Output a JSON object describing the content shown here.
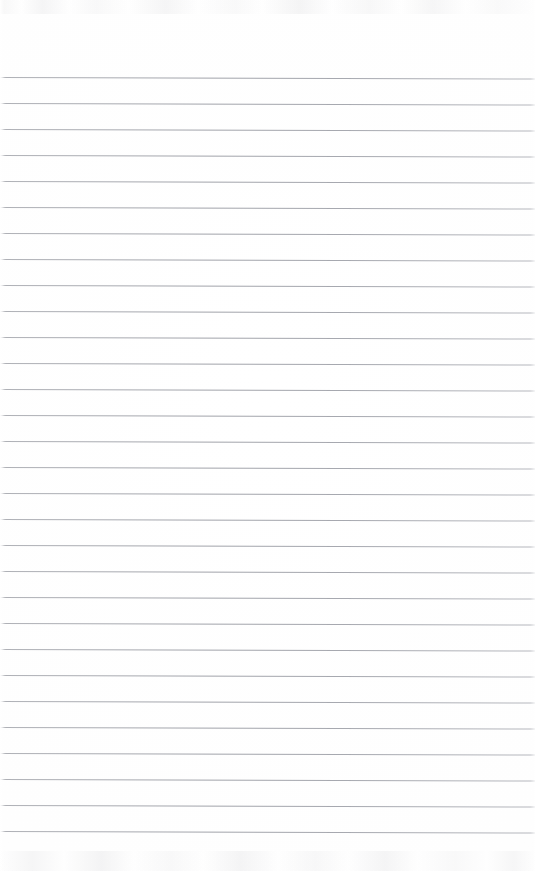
{
  "document": {
    "kind": "lined-notebook-page",
    "description": "Blank ruled notebook paper scan",
    "content_text": "",
    "has_handwriting": false,
    "has_margin_rule": false
  },
  "page": {
    "width_px": 535,
    "height_px": 871,
    "paper_color": "#fefefe",
    "background_color": "#ffffff"
  },
  "ruling": {
    "line_color": "#a0a2a9",
    "line_thickness_px": 1,
    "line_spacing_px": 26,
    "first_line_y_px": 77,
    "last_line_y_px": 847,
    "line_count": 30,
    "skew_degrees": 0.17,
    "left_inset_px": 0,
    "right_inset_px": 0,
    "line_y_positions": [
      77,
      103,
      129,
      155,
      181,
      207,
      233,
      259,
      285,
      311,
      321,
      337,
      363,
      389,
      415,
      441,
      467,
      493,
      519,
      545,
      571,
      597,
      623,
      649,
      675,
      701,
      727,
      743,
      769,
      795,
      821,
      847
    ]
  },
  "scan_artifacts": {
    "top_band_height_px": 14,
    "bottom_band_height_px": 20,
    "artifact_color": "#c8c8cb",
    "edge_fade_left_px": 4,
    "edge_fade_right_px": 5
  }
}
